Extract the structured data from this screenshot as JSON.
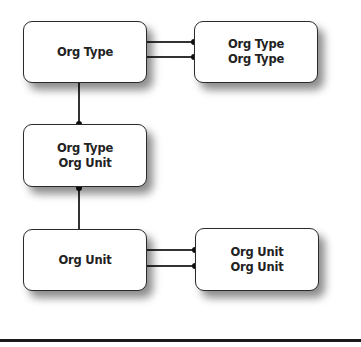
{
  "diagram": {
    "boxes": [
      {
        "id": "org-type",
        "lines": [
          "Org Type"
        ]
      },
      {
        "id": "org-type-org-type",
        "lines": [
          "Org Type",
          "Org Type"
        ]
      },
      {
        "id": "org-type-org-unit",
        "lines": [
          "Org Type",
          "Org Unit"
        ]
      },
      {
        "id": "org-unit",
        "lines": [
          "Org Unit"
        ]
      },
      {
        "id": "org-unit-org-unit",
        "lines": [
          "Org Unit",
          "Org Unit"
        ]
      }
    ],
    "connections": [
      {
        "from": "org-type",
        "to": "org-type-org-type",
        "count": 2
      },
      {
        "from": "org-type",
        "to": "org-type-org-unit",
        "count": 1
      },
      {
        "from": "org-unit",
        "to": "org-type-org-unit",
        "count": 1
      },
      {
        "from": "org-unit",
        "to": "org-unit-org-unit",
        "count": 2
      }
    ],
    "colors": {
      "line": "#333333",
      "box_border": "#2a2a2a",
      "box_fill": "#ffffff",
      "text": "#222222"
    }
  }
}
